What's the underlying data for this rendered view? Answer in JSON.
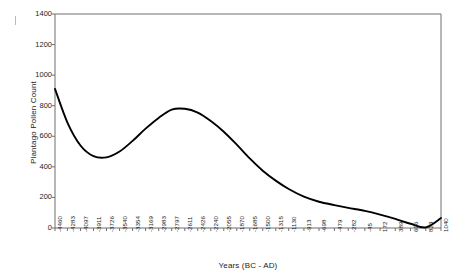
{
  "chart_data": {
    "type": "line",
    "title": "",
    "xlabel": "Years (BC - AD)",
    "ylabel": "Plantago Pollen Count",
    "ylim": [
      0,
      1400
    ],
    "yticks": [
      0,
      200,
      400,
      600,
      800,
      1000,
      1200,
      1400
    ],
    "grid": false,
    "legend": null,
    "x_tick_labels": [
      "-4460",
      "-4283",
      "-4097",
      "-3911",
      "-3726",
      "-3540",
      "-3354",
      "-3169",
      "-2983",
      "-2797",
      "-2611",
      "-2426",
      "-2240",
      "-2055",
      "-1870",
      "-1685",
      "-1500",
      "-1315",
      "-1130",
      "-913",
      "-698",
      "-479",
      "-282",
      "-45",
      "172",
      "389",
      "606",
      "823",
      "1040"
    ],
    "x": [
      -4460,
      -4283,
      -4097,
      -3911,
      -3726,
      -3540,
      -3354,
      -3169,
      -2983,
      -2797,
      -2611,
      -2426,
      -2240,
      -2055,
      -1870,
      -1685,
      -1500,
      -1315,
      -1130,
      -913,
      -698,
      -479,
      -282,
      -45,
      172,
      389,
      606,
      823,
      1040
    ],
    "values": [
      910,
      690,
      540,
      470,
      462,
      500,
      570,
      650,
      720,
      775,
      780,
      755,
      700,
      630,
      545,
      455,
      375,
      310,
      255,
      205,
      172,
      150,
      132,
      112,
      88,
      60,
      28,
      4,
      65
    ],
    "series": [
      {
        "name": "Plantago Pollen Count",
        "color": "#000000",
        "values": [
          910,
          690,
          540,
          470,
          462,
          500,
          570,
          650,
          720,
          775,
          780,
          755,
          700,
          630,
          545,
          455,
          375,
          310,
          255,
          205,
          172,
          150,
          132,
          112,
          88,
          60,
          28,
          4,
          65
        ]
      }
    ],
    "annotations": {
      "start_value": 910,
      "minimum_value": 462,
      "peak_value": 780,
      "end_value": 65
    }
  },
  "style": {
    "axis_color": "#6f6f6f",
    "line_color": "#000000",
    "text_color": "#1c1c1c",
    "background": "#ffffff"
  }
}
